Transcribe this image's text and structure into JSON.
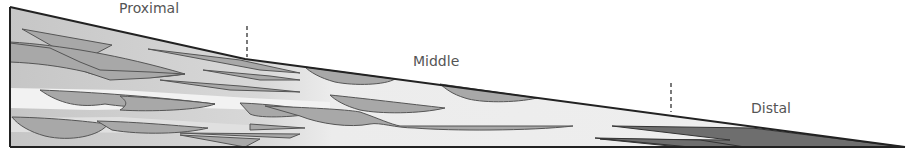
{
  "diagram": {
    "type": "cross-section",
    "zones": [
      {
        "label": "Proximal",
        "x": 88,
        "y": 1
      },
      {
        "label": "Middle",
        "x": 413,
        "y": 53
      },
      {
        "label": "Distal",
        "x": 751,
        "y": 100
      }
    ],
    "boundaries": [
      {
        "name": "proximal-middle",
        "x": 247
      },
      {
        "name": "middle-distal",
        "x": 671
      }
    ],
    "colors": {
      "outline": "#222222",
      "proximal_fill": "#c8c8c8",
      "middle_fill": "#ececec",
      "lens_fill": "#a8a8a8",
      "distal_fill": "#6e6e6e",
      "label": "#555555"
    }
  }
}
